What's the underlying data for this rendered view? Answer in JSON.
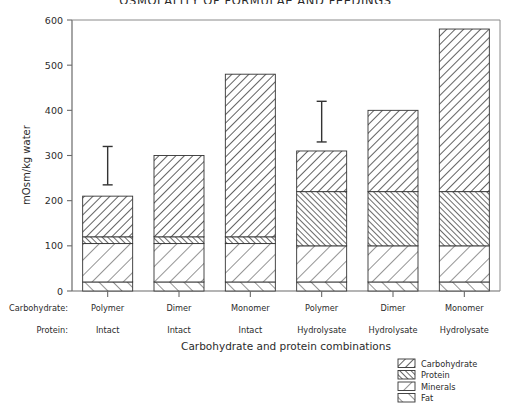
{
  "chart_data": {
    "type": "bar",
    "title": "OSMOLALITY OF FORMULAE AND FEEDINGS",
    "subtype": "stacked-bar",
    "xlabel": "Carbohydrate and protein combinations",
    "ylabel": "mOsm/kg water",
    "ylim": [
      0,
      600
    ],
    "yticks": [
      0,
      100,
      200,
      300,
      400,
      500,
      600
    ],
    "ytick_labels": [
      "0",
      "100",
      "200",
      "300",
      "400",
      "500",
      "600"
    ],
    "grid": false,
    "legend_position": "bottom-right",
    "categories": [
      "1",
      "2",
      "3",
      "4",
      "5",
      "6"
    ],
    "category_rows": [
      {
        "name": "Carbohydrate:",
        "values": [
          "Polymer",
          "Dimer",
          "Monomer",
          "Polymer",
          "Dimer",
          "Monomer"
        ]
      },
      {
        "name": "Protein:",
        "values": [
          "Intact",
          "Intact",
          "Intact",
          "Hydrolysate",
          "Hydrolysate",
          "Hydrolysate"
        ]
      }
    ],
    "series": [
      {
        "name": "Fat",
        "values": [
          20,
          20,
          20,
          20,
          20,
          20
        ]
      },
      {
        "name": "Minerals",
        "values": [
          85,
          85,
          85,
          80,
          80,
          80
        ]
      },
      {
        "name": "Protein",
        "values": [
          15,
          15,
          15,
          120,
          120,
          120
        ]
      },
      {
        "name": "Carbohydrate",
        "values": [
          90,
          180,
          360,
          90,
          180,
          360
        ]
      }
    ],
    "totals": [
      210,
      300,
      480,
      310,
      400,
      580
    ],
    "error_bars": [
      {
        "category_index": 0,
        "value": 210,
        "upper": 320,
        "lower": 235
      },
      {
        "category_index": 3,
        "value": 310,
        "upper": 420,
        "lower": 330
      }
    ],
    "legend": [
      {
        "label": "Carbohydrate",
        "pattern": "diagonal-up-dense"
      },
      {
        "label": "Protein",
        "pattern": "diagonal-down-dense"
      },
      {
        "label": "Minerals",
        "pattern": "diagonal-up-wide"
      },
      {
        "label": "Fat",
        "pattern": "diagonal-down-wide"
      }
    ]
  }
}
